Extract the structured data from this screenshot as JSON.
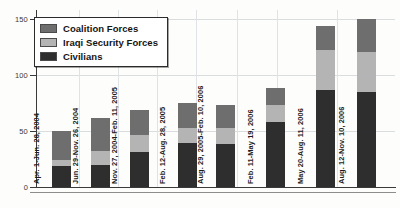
{
  "chart_data": {
    "type": "bar",
    "subtype": "stacked-vertical",
    "title": "",
    "xlabel": "",
    "ylabel": "",
    "ylim": [
      0,
      150
    ],
    "yticks": [
      0,
      50,
      100,
      150
    ],
    "grid": true,
    "legend_position": "top-left",
    "categories": [
      "Apr. 1-Jun. 28, 2004",
      "Jun. 29-Nov. 26, 2004",
      "Nov. 27, 2004-Feb. 11, 2005",
      "Feb. 12-Aug. 28, 2005",
      "Aug. 29, 2005-Feb. 10, 2006",
      "Feb. 11-May 19, 2006",
      "May 20-Aug. 11, 2006",
      "Aug. 12-Nov. 10, 2006"
    ],
    "series": [
      {
        "name": "Civilians",
        "color": "#2e2e2e",
        "values": [
          19,
          20,
          31,
          39,
          38,
          58,
          87,
          85
        ]
      },
      {
        "name": "Iraqi Security Forces",
        "color": "#b4b4b4",
        "values": [
          5,
          12,
          15,
          14,
          15,
          15,
          35,
          36
        ]
      },
      {
        "name": "Coalition Forces",
        "color": "#6e6e6e",
        "values": [
          26,
          30,
          23,
          22,
          20,
          15,
          22,
          29
        ]
      }
    ],
    "totals": [
      50,
      62,
      69,
      75,
      73,
      88,
      144,
      150
    ]
  },
  "legend": {
    "items": [
      {
        "label": "Coalition Forces",
        "swatch": "coalition"
      },
      {
        "label": "Iraqi Security Forces",
        "swatch": "iraqi"
      },
      {
        "label": "Civilians",
        "swatch": "civilian"
      }
    ]
  },
  "axis": {
    "y_tick_labels": [
      "150",
      "100",
      "50",
      "0"
    ]
  }
}
